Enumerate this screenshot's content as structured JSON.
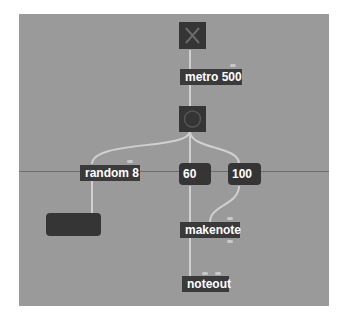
{
  "patcher": {
    "background": "#9a9a9a",
    "objects": {
      "toggle": {
        "label": "toggle",
        "state": "off"
      },
      "metro": {
        "text": "metro 500"
      },
      "bang": {
        "label": "bang"
      },
      "random": {
        "text": "random 8"
      },
      "pitch": {
        "value": "60"
      },
      "velocity": {
        "value": "100"
      },
      "output_number": {
        "value": ""
      },
      "makenote": {
        "text": "makenote"
      },
      "noteout": {
        "text": "noteout"
      }
    }
  }
}
